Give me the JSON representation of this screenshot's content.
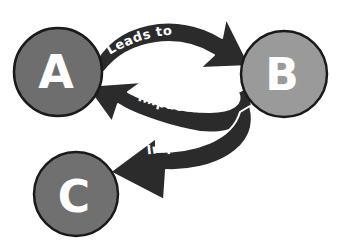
{
  "diagram": {
    "type": "cause-effect cycle",
    "background": "#ffffff",
    "nodes": [
      {
        "id": "A",
        "label": "A",
        "fill": "#6e6e6e",
        "cx": 58,
        "cy": 72,
        "r": 44
      },
      {
        "id": "B",
        "label": "B",
        "fill": "#9a9a9a",
        "cx": 284,
        "cy": 74,
        "r": 43
      },
      {
        "id": "C",
        "label": "C",
        "fill": "#707070",
        "cx": 76,
        "cy": 194,
        "r": 42
      }
    ],
    "edges": [
      {
        "from": "A",
        "to": "B",
        "label": "Leads to",
        "color": "#2b2b2b"
      },
      {
        "from": "B",
        "to": "A",
        "label": "Impacts",
        "color": "#2b2b2b"
      },
      {
        "from": "B",
        "to": "C",
        "label": "Impacts",
        "color": "#2b2b2b"
      }
    ]
  }
}
